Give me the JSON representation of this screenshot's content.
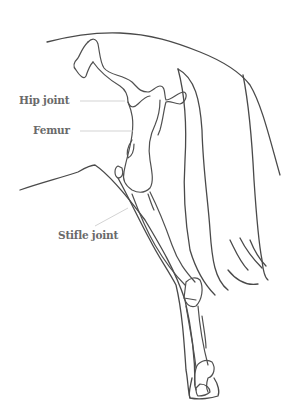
{
  "diagram": {
    "labels": [
      {
        "id": "hip-joint",
        "text": "Hip joint"
      },
      {
        "id": "femur",
        "text": "Femur"
      },
      {
        "id": "stifle-joint",
        "text": "Stifle joint"
      }
    ],
    "colors": {
      "background": "#ffffff",
      "line": "#4a4a4a",
      "label_text": "#6a6a6a",
      "leader_line": "#c8c8c8"
    }
  }
}
